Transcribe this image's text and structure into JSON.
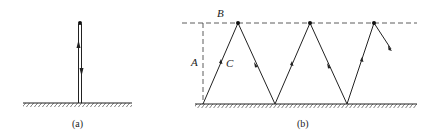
{
  "figure": {
    "panels": [
      {
        "id": "a",
        "caption": "(a)",
        "description": "Vertical throw: ball goes straight up and falls straight back down to the ground"
      },
      {
        "id": "b",
        "caption": "(b)",
        "description": "Ball bouncing in a zigzag path between the ground and a maximum height line"
      }
    ],
    "labels": {
      "height": "A",
      "max_height_line": "B",
      "path": "C"
    },
    "colors": {
      "line": "#222222",
      "background": "#ffffff"
    }
  }
}
